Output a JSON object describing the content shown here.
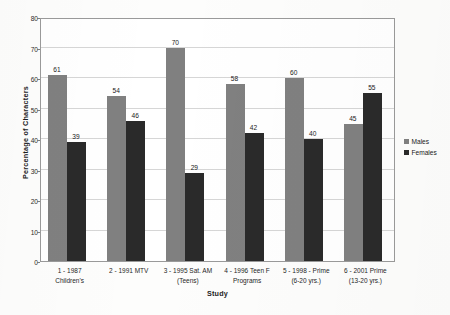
{
  "chart_data": {
    "type": "bar",
    "title": "",
    "subtitle": "",
    "xlabel": "Study",
    "ylabel": "Percentage of Characters",
    "ylim": [
      0,
      80
    ],
    "y_ticks": [
      0,
      10,
      20,
      30,
      40,
      50,
      60,
      70,
      80
    ],
    "grid": "horizontal",
    "legend_position": "right",
    "categories": [
      {
        "line1": "1 - 1987",
        "line2": "Children's"
      },
      {
        "line1": "2 - 1991 MTV",
        "line2": ""
      },
      {
        "line1": "3 - 1995 Sat. AM",
        "line2": "(Teens)"
      },
      {
        "line1": "4 - 1996 Teen F",
        "line2": "Programs"
      },
      {
        "line1": "5 - 1998 - Prime",
        "line2": "(6-20 yrs.)"
      },
      {
        "line1": "6 - 2001 Prime",
        "line2": "(13-20 yrs.)"
      }
    ],
    "series": [
      {
        "name": "Males",
        "color": "#808080",
        "values": [
          61,
          54,
          70,
          58,
          60,
          45
        ]
      },
      {
        "name": "Females",
        "color": "#2a2a2a",
        "values": [
          39,
          46,
          29,
          42,
          40,
          55
        ]
      }
    ]
  },
  "legend": {
    "items": [
      {
        "label": "Males",
        "color": "#808080"
      },
      {
        "label": "Females",
        "color": "#2a2a2a"
      }
    ]
  },
  "axes": {
    "y_title": "Percentage of Characters",
    "x_title": "Study"
  },
  "colors": {
    "males": "#808080",
    "females": "#2a2a2a",
    "gridline": "#d6d6d6",
    "plot_border": "#9a9a9a",
    "background": "#fdfdfc"
  }
}
